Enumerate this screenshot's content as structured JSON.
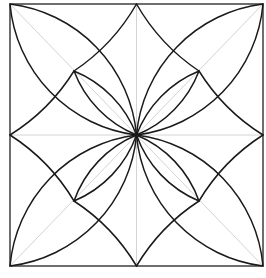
{
  "colors": {
    "background": "#ffffff",
    "frame": "#4a4a4a",
    "guide": "#d4d4d4",
    "ink": "#1a1a1a"
  },
  "frame": {
    "x": 10,
    "y": 4,
    "width": 253,
    "height": 262
  },
  "points": {
    "center": [
      136.5,
      135
    ],
    "corners": {
      "tl": [
        10,
        4
      ],
      "tr": [
        263,
        4
      ],
      "bl": [
        10,
        266
      ],
      "br": [
        263,
        266
      ]
    },
    "midpoints": {
      "top": [
        136.5,
        4
      ],
      "left": [
        10,
        135
      ],
      "right": [
        263,
        135
      ],
      "bottom": [
        136.5,
        266
      ]
    },
    "inner": {
      "tl": [
        74,
        71
      ],
      "tr": [
        199,
        71
      ],
      "bl": [
        74,
        201
      ],
      "br": [
        199,
        201
      ]
    }
  },
  "guides": [
    {
      "name": "diagonal-tl-br",
      "from": [
        10,
        4
      ],
      "to": [
        263,
        266
      ]
    },
    {
      "name": "diagonal-tr-bl",
      "from": [
        263,
        4
      ],
      "to": [
        10,
        266
      ]
    },
    {
      "name": "vertical-center",
      "from": [
        136.5,
        4
      ],
      "to": [
        136.5,
        266
      ]
    },
    {
      "name": "horizontal-center",
      "from": [
        10,
        135
      ],
      "to": [
        263,
        135
      ]
    }
  ],
  "big_lenses": [
    {
      "name": "big-petal-tl",
      "from": [
        10,
        4
      ],
      "to": [
        136.5,
        135
      ],
      "radius": 145
    },
    {
      "name": "big-petal-tr",
      "from": [
        263,
        4
      ],
      "to": [
        136.5,
        135
      ],
      "radius": 145
    },
    {
      "name": "big-petal-bl",
      "from": [
        10,
        266
      ],
      "to": [
        136.5,
        135
      ],
      "radius": 145
    },
    {
      "name": "big-petal-br",
      "from": [
        263,
        266
      ],
      "to": [
        136.5,
        135
      ],
      "radius": 145
    }
  ],
  "small_lenses": [
    {
      "name": "small-petal-tl",
      "from": [
        74,
        71
      ],
      "to": [
        136.5,
        135
      ],
      "radius": 112
    },
    {
      "name": "small-petal-tr",
      "from": [
        199,
        71
      ],
      "to": [
        136.5,
        135
      ],
      "radius": 112
    },
    {
      "name": "small-petal-bl",
      "from": [
        74,
        201
      ],
      "to": [
        136.5,
        135
      ],
      "radius": 112
    },
    {
      "name": "small-petal-br",
      "from": [
        199,
        201
      ],
      "to": [
        136.5,
        135
      ],
      "radius": 112
    }
  ],
  "diamond_arcs": [
    {
      "name": "diamond-arc-top-tl",
      "from": [
        136.5,
        4
      ],
      "to": [
        74,
        71
      ],
      "radius": 200,
      "sweep": 1
    },
    {
      "name": "diamond-arc-left-tl",
      "from": [
        10,
        135
      ],
      "to": [
        74,
        71
      ],
      "radius": 200,
      "sweep": 0
    },
    {
      "name": "diamond-arc-top-tr",
      "from": [
        136.5,
        4
      ],
      "to": [
        199,
        71
      ],
      "radius": 200,
      "sweep": 0
    },
    {
      "name": "diamond-arc-right-tr",
      "from": [
        263,
        135
      ],
      "to": [
        199,
        71
      ],
      "radius": 200,
      "sweep": 1
    },
    {
      "name": "diamond-arc-left-bl",
      "from": [
        10,
        135
      ],
      "to": [
        74,
        201
      ],
      "radius": 200,
      "sweep": 1
    },
    {
      "name": "diamond-arc-bottom-bl",
      "from": [
        136.5,
        266
      ],
      "to": [
        74,
        201
      ],
      "radius": 200,
      "sweep": 0
    },
    {
      "name": "diamond-arc-right-br",
      "from": [
        263,
        135
      ],
      "to": [
        199,
        201
      ],
      "radius": 200,
      "sweep": 0
    },
    {
      "name": "diamond-arc-bottom-br",
      "from": [
        136.5,
        266
      ],
      "to": [
        199,
        201
      ],
      "radius": 200,
      "sweep": 1
    }
  ]
}
